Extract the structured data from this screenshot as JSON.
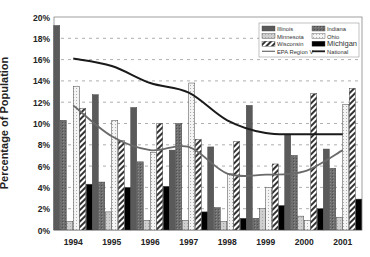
{
  "chart_data": {
    "type": "bar",
    "title": "",
    "xlabel": "",
    "ylabel": "Percentage of Population",
    "ylim": [
      0,
      20
    ],
    "y_ticks": [
      "0%",
      "2%",
      "4%",
      "6%",
      "8%",
      "10%",
      "12%",
      "14%",
      "16%",
      "18%",
      "20%"
    ],
    "grid": "horizontal dashed",
    "legend_position": "upper right (inside)",
    "categories": [
      "1994",
      "1995",
      "1996",
      "1997",
      "1998",
      "1999",
      "2000",
      "2001"
    ],
    "series": [
      {
        "name": "Illinois",
        "kind": "bar",
        "values": [
          19.2,
          12.7,
          11.5,
          7.5,
          7.8,
          11.7,
          9.0,
          7.6
        ]
      },
      {
        "name": "Indiana",
        "kind": "bar",
        "values": [
          10.3,
          4.5,
          6.4,
          10.0,
          2.1,
          1.1,
          7.0,
          5.8
        ]
      },
      {
        "name": "Minnesota",
        "kind": "bar",
        "values": [
          0.8,
          1.7,
          0.9,
          0.9,
          0.8,
          2.0,
          1.3,
          1.2
        ]
      },
      {
        "name": "Ohio",
        "kind": "bar",
        "values": [
          13.5,
          10.3,
          7.3,
          13.8,
          5.3,
          4.0,
          0.9,
          11.8
        ]
      },
      {
        "name": "Wisconsin",
        "kind": "bar",
        "values": [
          11.4,
          8.4,
          10.0,
          8.5,
          8.3,
          6.2,
          12.8,
          13.3
        ]
      },
      {
        "name": "Michigan",
        "kind": "bar",
        "values": [
          4.3,
          4.0,
          4.1,
          1.7,
          1.1,
          2.3,
          2.0,
          2.9
        ]
      },
      {
        "name": "EPA Region V",
        "kind": "line",
        "values": [
          11.7,
          8.8,
          7.5,
          7.8,
          5.3,
          5.2,
          5.5,
          7.5
        ]
      },
      {
        "name": "National",
        "kind": "line",
        "values": [
          16.1,
          15.4,
          13.8,
          12.9,
          10.3,
          9.1,
          9.0,
          9.0
        ]
      }
    ]
  },
  "legend": {
    "items": [
      "Illinois",
      "Indiana",
      "Minnesota",
      "Ohio",
      "Wisconsin",
      "Michigan",
      "EPA Region V",
      "National"
    ]
  },
  "colors": {
    "illinois": "#5a5a5a",
    "indiana": "#6e6e6e",
    "minnesota": "#c8c8c8",
    "ohio": "#f2f2f2",
    "wisconsin": "#ffffff",
    "michigan": "#000000",
    "region_line": "#6a6a6a",
    "national_line": "#1a1a1a",
    "grid": "#9a9a9a"
  }
}
